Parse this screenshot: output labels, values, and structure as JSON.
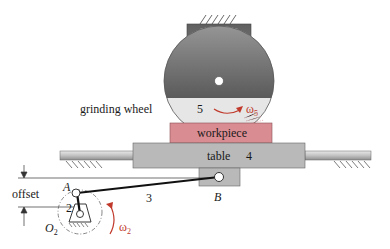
{
  "diagram": {
    "type": "mechanism-schematic",
    "labels": {
      "grinding_wheel": "grinding wheel",
      "wheel_number": "5",
      "omega5": "ω",
      "omega5_sub": "5",
      "workpiece": "workpiece",
      "table": "table",
      "table_number": "4",
      "link3": "3",
      "crank_number": "2",
      "pin_a": "A",
      "pin_b": "B",
      "ground_pivot": "O",
      "ground_pivot_sub": "2",
      "offset": "offset",
      "omega2": "ω",
      "omega2_sub": "2"
    },
    "colors": {
      "wheel_dark": "#6e6e6e",
      "wheel_light": "#e6e6e6",
      "workpiece": "#d98c92",
      "table": "#b9b9b9",
      "rod": "#c4c4c4",
      "link": "#111111",
      "accent_red": "#c0392b"
    }
  }
}
